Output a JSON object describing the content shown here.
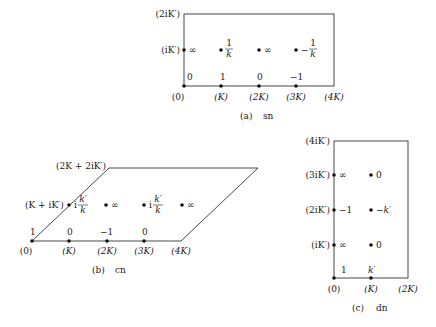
{
  "panels": {
    "sn": {
      "caption_tag": "(a)",
      "caption_fn": "sn",
      "corner_labels": {
        "top_left": "(2iK′)",
        "mid_left": "(iK′)"
      },
      "bottom_labels": [
        "(0)",
        "(K)",
        "(2K)",
        "(3K)",
        "(4K)"
      ],
      "real_axis_values": [
        "0",
        "1",
        "0",
        "−1"
      ],
      "mid_row_values": [
        {
          "type": "text",
          "value": "∞"
        },
        {
          "type": "frac",
          "num": "1",
          "den": "k",
          "sign": ""
        },
        {
          "type": "text",
          "value": "∞"
        },
        {
          "type": "frac",
          "num": "1",
          "den": "k",
          "sign": "−"
        }
      ]
    },
    "cn": {
      "caption_tag": "(b)",
      "caption_fn": "cn",
      "corner_labels": {
        "top_left": "(2K + 2iK′)",
        "mid_left": "(K + iK′)"
      },
      "bottom_labels": [
        "(0)",
        "(K)",
        "(2K)",
        "(3K)",
        "(4K)"
      ],
      "real_axis_values": [
        "1",
        "0",
        "−1",
        "0"
      ],
      "mid_row_values": [
        {
          "type": "frac",
          "num": "k′",
          "den": "k",
          "sign": "i"
        },
        {
          "type": "text",
          "value": "∞"
        },
        {
          "type": "frac",
          "num": "k′",
          "den": "k",
          "sign": "i"
        },
        {
          "type": "text",
          "value": "∞"
        }
      ]
    },
    "dn": {
      "caption_tag": "(c)",
      "caption_fn": "dn",
      "left_labels": [
        "(iK′)",
        "(2iK′)",
        "(3iK′)",
        "(4iK′)"
      ],
      "bottom_labels": [
        "(0)",
        "(K)",
        "(2K)"
      ],
      "real_axis_values": [
        "1",
        "k′"
      ],
      "left_column_values": [
        "∞",
        "−1",
        "∞"
      ],
      "mid_column_values": [
        "0",
        "−k′",
        "0"
      ]
    }
  }
}
